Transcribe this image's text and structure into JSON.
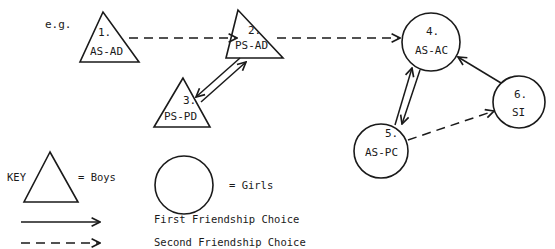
{
  "diagram": {
    "prefix_label": "e.g.",
    "nodes": [
      {
        "id": "1",
        "number": "1.",
        "label": "AS-AD",
        "shape": "triangle",
        "gender": "boy"
      },
      {
        "id": "2",
        "number": "2.",
        "label": "PS-AD",
        "shape": "triangle",
        "gender": "boy"
      },
      {
        "id": "3",
        "number": "3.",
        "label": "PS-PD",
        "shape": "triangle",
        "gender": "boy"
      },
      {
        "id": "4",
        "number": "4.",
        "label": "AS-AC",
        "shape": "circle",
        "gender": "girl"
      },
      {
        "id": "5",
        "number": "5.",
        "label": "AS-PC",
        "shape": "circle",
        "gender": "girl"
      },
      {
        "id": "6",
        "number": "6.",
        "label": "SI",
        "shape": "circle",
        "gender": "girl"
      }
    ],
    "edges": [
      {
        "from": "1",
        "to": "2",
        "type": "second-choice"
      },
      {
        "from": "2",
        "to": "4",
        "type": "second-choice"
      },
      {
        "from": "2",
        "to": "3",
        "type": "first-choice"
      },
      {
        "from": "3",
        "to": "2",
        "type": "first-choice"
      },
      {
        "from": "4",
        "to": "5",
        "type": "first-choice"
      },
      {
        "from": "5",
        "to": "4",
        "type": "first-choice"
      },
      {
        "from": "6",
        "to": "4",
        "type": "first-choice"
      },
      {
        "from": "5",
        "to": "6",
        "type": "second-choice"
      }
    ]
  },
  "key": {
    "title": "KEY",
    "boys_label": "= Boys",
    "girls_label": "= Girls",
    "first_choice_label": "First Friendship Choice",
    "second_choice_label": "Second Friendship Choice"
  },
  "colors": {
    "ink": "#1a1a1a",
    "background": "#ffffff"
  }
}
